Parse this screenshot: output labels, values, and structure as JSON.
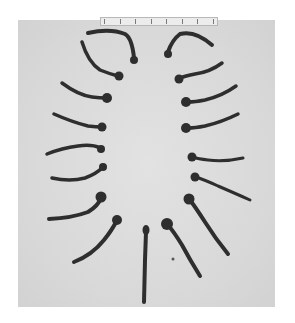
{
  "photo": {
    "subject": "iron-nails-arrangement",
    "nail_count": 17,
    "background_color": "#dcdcdc",
    "nail_color": "#2e2e2e",
    "scale_ruler": {
      "visible": true,
      "tick_count": 8
    }
  }
}
